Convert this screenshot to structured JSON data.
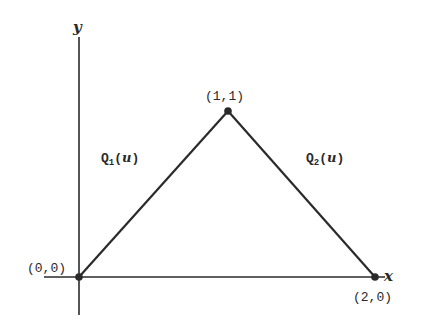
{
  "diagram": {
    "axes": {
      "x_label": "x",
      "y_label": "y"
    },
    "points": [
      {
        "label": "(0,0)",
        "x": 0,
        "y": 0
      },
      {
        "label": "(1,1)",
        "x": 1,
        "y": 1
      },
      {
        "label": "(2,0)",
        "x": 2,
        "y": 0
      }
    ],
    "segments": [
      {
        "name": "Q",
        "subscript": "1",
        "param": "u",
        "from": "(0,0)",
        "to": "(1,1)"
      },
      {
        "name": "Q",
        "subscript": "2",
        "param": "u",
        "from": "(1,1)",
        "to": "(2,0)"
      }
    ],
    "colors": {
      "line": "#2a2a2a",
      "background": "#ffffff"
    }
  }
}
